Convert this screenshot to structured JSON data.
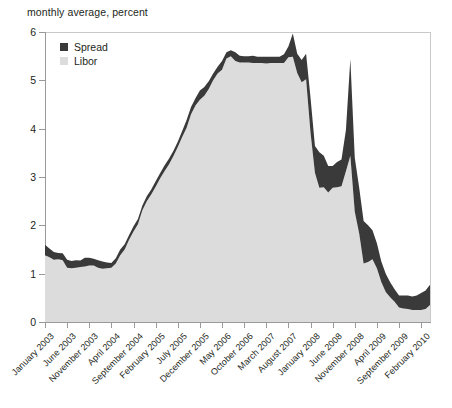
{
  "subtitle": "monthly average, percent",
  "legend": {
    "items": [
      {
        "label": "Spread",
        "color": "#3a3a3a",
        "icon": "square-swatch-icon"
      },
      {
        "label": "Libor",
        "color": "#dcdcdc",
        "icon": "square-swatch-icon"
      }
    ]
  },
  "axes": {
    "y_ticks": [
      "0",
      "1",
      "2",
      "3",
      "4",
      "5",
      "6"
    ],
    "x_ticks": [
      "January 2003",
      "June 2003",
      "November 2003",
      "April 2004",
      "September 2004",
      "February 2005",
      "July 2005",
      "December 2005",
      "May 2006",
      "October 2006",
      "March 2007",
      "August 2007",
      "January 2008",
      "June 2008",
      "November 2008",
      "April 2009",
      "September 2009",
      "February 2010"
    ]
  },
  "chart_data": {
    "type": "area",
    "stacked": true,
    "title": "",
    "subtitle": "monthly average, percent",
    "xlabel": "",
    "ylabel": "",
    "ylim": [
      0,
      6
    ],
    "grid": false,
    "legend_position": "top-left",
    "x_tick_every_months": 5,
    "x_start": "January 2003",
    "x_end": "April 2010",
    "categories": [
      "January 2003",
      "February 2003",
      "March 2003",
      "April 2003",
      "May 2003",
      "June 2003",
      "July 2003",
      "August 2003",
      "September 2003",
      "October 2003",
      "November 2003",
      "December 2003",
      "January 2004",
      "February 2004",
      "March 2004",
      "April 2004",
      "May 2004",
      "June 2004",
      "July 2004",
      "August 2004",
      "September 2004",
      "October 2004",
      "November 2004",
      "December 2004",
      "January 2005",
      "February 2005",
      "March 2005",
      "April 2005",
      "May 2005",
      "June 2005",
      "July 2005",
      "August 2005",
      "September 2005",
      "October 2005",
      "November 2005",
      "December 2005",
      "January 2006",
      "February 2006",
      "March 2006",
      "April 2006",
      "May 2006",
      "June 2006",
      "July 2006",
      "August 2006",
      "September 2006",
      "October 2006",
      "November 2006",
      "December 2006",
      "January 2007",
      "February 2007",
      "March 2007",
      "April 2007",
      "May 2007",
      "June 2007",
      "July 2007",
      "August 2007",
      "September 2007",
      "October 2007",
      "November 2007",
      "December 2007",
      "January 2008",
      "February 2008",
      "March 2008",
      "April 2008",
      "May 2008",
      "June 2008",
      "July 2008",
      "August 2008",
      "September 2008",
      "October 2008",
      "November 2008",
      "December 2008",
      "January 2009",
      "February 2009",
      "March 2009",
      "April 2009",
      "May 2009",
      "June 2009",
      "July 2009",
      "August 2009",
      "September 2009",
      "October 2009",
      "November 2009",
      "December 2009",
      "January 2010",
      "February 2010",
      "March 2010",
      "April 2010"
    ],
    "series": [
      {
        "name": "Libor",
        "color": "#dcdcdc",
        "values": [
          1.38,
          1.34,
          1.29,
          1.3,
          1.28,
          1.12,
          1.11,
          1.12,
          1.14,
          1.15,
          1.17,
          1.17,
          1.12,
          1.1,
          1.11,
          1.12,
          1.21,
          1.38,
          1.5,
          1.7,
          1.87,
          2.02,
          2.31,
          2.5,
          2.64,
          2.8,
          2.97,
          3.12,
          3.26,
          3.43,
          3.62,
          3.83,
          4.02,
          4.3,
          4.48,
          4.6,
          4.68,
          4.82,
          5.0,
          5.14,
          5.22,
          5.45,
          5.5,
          5.4,
          5.37,
          5.37,
          5.37,
          5.36,
          5.36,
          5.36,
          5.35,
          5.36,
          5.36,
          5.36,
          5.36,
          5.48,
          5.49,
          5.15,
          4.96,
          5.02,
          3.92,
          3.09,
          2.78,
          2.79,
          2.68,
          2.78,
          2.79,
          2.81,
          3.12,
          3.44,
          2.28,
          1.83,
          1.21,
          1.24,
          1.3,
          1.11,
          0.83,
          0.62,
          0.51,
          0.42,
          0.3,
          0.28,
          0.27,
          0.25,
          0.25,
          0.25,
          0.27,
          0.35
        ]
      },
      {
        "name": "Spread",
        "color": "#3a3a3a",
        "values": [
          0.22,
          0.18,
          0.16,
          0.13,
          0.14,
          0.17,
          0.15,
          0.16,
          0.13,
          0.18,
          0.16,
          0.14,
          0.16,
          0.15,
          0.12,
          0.1,
          0.11,
          0.12,
          0.11,
          0.1,
          0.11,
          0.11,
          0.1,
          0.1,
          0.1,
          0.11,
          0.11,
          0.12,
          0.12,
          0.11,
          0.11,
          0.12,
          0.16,
          0.15,
          0.15,
          0.19,
          0.18,
          0.16,
          0.14,
          0.14,
          0.18,
          0.13,
          0.12,
          0.18,
          0.14,
          0.13,
          0.13,
          0.15,
          0.13,
          0.13,
          0.14,
          0.13,
          0.13,
          0.13,
          0.18,
          0.22,
          0.48,
          0.4,
          0.46,
          0.53,
          0.72,
          0.55,
          0.73,
          0.65,
          0.55,
          0.45,
          0.52,
          0.55,
          0.85,
          2.0,
          1.12,
          0.95,
          0.88,
          0.76,
          0.6,
          0.52,
          0.42,
          0.38,
          0.31,
          0.26,
          0.25,
          0.27,
          0.28,
          0.28,
          0.3,
          0.35,
          0.38,
          0.42
        ]
      }
    ]
  }
}
